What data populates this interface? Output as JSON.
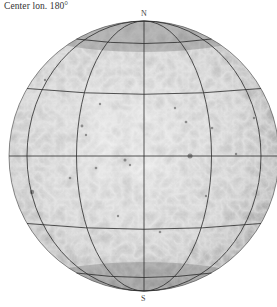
{
  "map": {
    "caption": "Center lon. 180°",
    "north_label": "N",
    "south_label": "S",
    "projection": "orthographic",
    "center_longitude": 180,
    "graticule": {
      "meridian_spacing_deg": 30,
      "parallel_spacing_deg": 30,
      "line_color": "#2a2a2a"
    },
    "surface_tone": {
      "light": "#e6e6e6",
      "mid": "#b8b8b8",
      "dark": "#7a7a7a"
    }
  }
}
